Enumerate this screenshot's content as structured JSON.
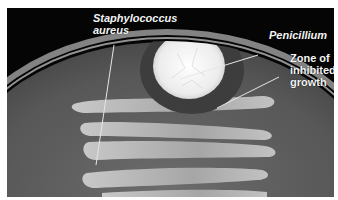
{
  "figure": {
    "labels": {
      "staph_line1": "Staphylococcus",
      "staph_line2": "aureus",
      "penicillium": "Penicillium",
      "zone_line1": "Zone of",
      "zone_line2": "inhibited",
      "zone_line3": "growth"
    },
    "colors": {
      "background": "#050505",
      "agar": "#5e5e5e",
      "colony": "#f0f0f0",
      "streak": "#b4b4b4",
      "inhibited_zone": "#3c3c3c",
      "text": "#f4f4f4"
    }
  }
}
